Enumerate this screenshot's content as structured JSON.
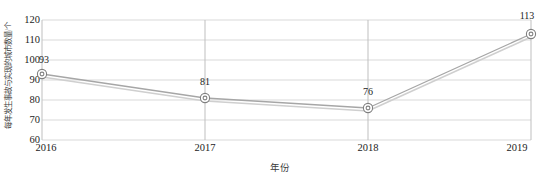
{
  "chart_data": {
    "type": "line",
    "title": "",
    "xlabel": "年份",
    "ylabel": "每年发生事故与实现的城市数量/个",
    "categories": [
      "2016",
      "2017",
      "2018",
      "2019"
    ],
    "values": [
      93,
      81,
      76,
      113
    ],
    "series": [
      {
        "name": "城市数量",
        "values": [
          93,
          81,
          76,
          113
        ]
      }
    ],
    "ylim": [
      60,
      120
    ],
    "y_ticks": [
      60,
      70,
      80,
      90,
      100,
      110,
      120
    ],
    "y_tick_labels": [
      "60",
      "70",
      "80",
      "90",
      "100",
      "110",
      "120"
    ],
    "x_tick_labels": [
      "2016",
      "2017",
      "2018",
      "2019"
    ],
    "data_labels": [
      "93",
      "81",
      "76",
      "113"
    ],
    "grid": true,
    "grid_axis": "both",
    "legend": false,
    "legend_position": "none",
    "marker": "ring-circle",
    "colors": {
      "line": "#a6a6a6",
      "shadow_line": "#cfcfcf",
      "marker_stroke": "#808080",
      "marker_fill": "#ffffff",
      "grid": "#d9d9d9",
      "axis": "#bfbfbf",
      "text": "#1c1c1c",
      "background": "#ffffff"
    }
  }
}
